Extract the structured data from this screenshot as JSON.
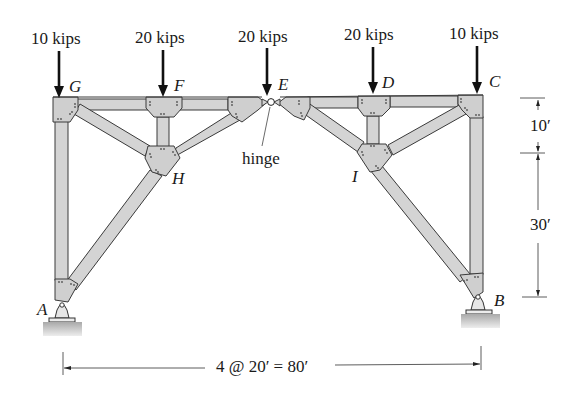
{
  "figure": {
    "loads": [
      {
        "label": "10 kips",
        "node": "G"
      },
      {
        "label": "20 kips",
        "node": "F"
      },
      {
        "label": "20 kips",
        "node": "E"
      },
      {
        "label": "20 kips",
        "node": "D"
      },
      {
        "label": "10 kips",
        "node": "C"
      }
    ],
    "nodes": {
      "A": "A",
      "B": "B",
      "C": "C",
      "D": "D",
      "E": "E",
      "F": "F",
      "G": "G",
      "H": "H",
      "I": "I"
    },
    "hinge_label": "hinge",
    "dimensions": {
      "upper_height": "10′",
      "lower_height": "30′",
      "span": "4 @ 20′ = 80′"
    },
    "colors": {
      "member_fill": "#d4d4d4",
      "member_stroke": "#3a3a3a",
      "gusset_fill": "#cfcfcf",
      "ground_fill": "#bdbdbd",
      "text": "#1a1a1a",
      "arrow": "#111111"
    }
  }
}
